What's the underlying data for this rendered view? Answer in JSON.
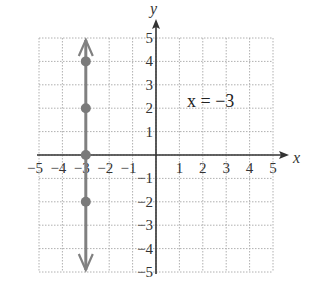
{
  "chart_data": {
    "type": "line",
    "title": "",
    "xlabel": "x",
    "ylabel": "y",
    "xlim": [
      -5,
      5
    ],
    "ylim": [
      -5,
      5
    ],
    "grid": true,
    "x_ticks": [
      -5,
      -4,
      -3,
      -2,
      -1,
      1,
      2,
      3,
      4,
      5
    ],
    "y_ticks": [
      -5,
      -4,
      -3,
      -2,
      -1,
      1,
      2,
      3,
      4,
      5
    ],
    "x_tick_labels": [
      "−5",
      "−4",
      "−3",
      "−2",
      "−1",
      "1",
      "2",
      "3",
      "4",
      "5"
    ],
    "y_tick_labels": [
      "−5",
      "−4",
      "−3",
      "−2",
      "−1",
      "1",
      "2",
      "3",
      "4",
      "5"
    ],
    "series": [
      {
        "name": "x = −3",
        "kind": "vertical line with arrows at both ends",
        "x": [
          -3,
          -3
        ],
        "y": [
          -5,
          5
        ],
        "points": [
          [
            -3,
            4
          ],
          [
            -3,
            2
          ],
          [
            -3,
            0
          ],
          [
            -3,
            -2
          ]
        ]
      }
    ],
    "annotations": [
      {
        "text": "x = −3",
        "x": 2.1,
        "y": 2
      }
    ]
  },
  "labels": {
    "x_axis": "x",
    "y_axis": "y",
    "equation": "x = −3"
  },
  "colors": {
    "line": "#808080",
    "points": "#7a7a7a",
    "axes": "#333333",
    "grid": "#b0b0b0"
  }
}
